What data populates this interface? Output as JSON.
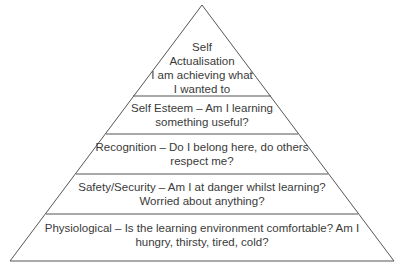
{
  "diagram": {
    "type": "pyramid",
    "line_color": "#555555",
    "levels": [
      {
        "name": "self-actualisation",
        "lines": [
          "Self",
          "Actualisation",
          "I am achieving what",
          "I wanted to"
        ]
      },
      {
        "name": "self-esteem",
        "lines": [
          "Self Esteem – Am I learning",
          "something useful?"
        ]
      },
      {
        "name": "recognition",
        "lines": [
          "Recognition – Do I belong here, do others",
          "respect me?"
        ]
      },
      {
        "name": "safety-security",
        "lines": [
          "Safety/Security – Am I at danger whilst learning?",
          "Worried about anything?"
        ]
      },
      {
        "name": "physiological",
        "lines": [
          "Physiological – Is the learning environment comfortable? Am I",
          "hungry, thirsty, tired, cold?"
        ]
      }
    ]
  }
}
